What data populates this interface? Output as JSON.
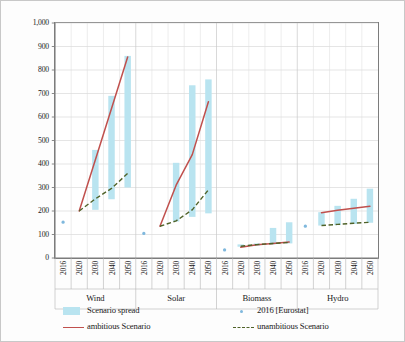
{
  "chart_data": {
    "type": "bar",
    "title": "",
    "xlabel": "",
    "ylabel": "Installed capacities [GW]",
    "ylim": [
      0,
      1000
    ],
    "ytick_labels": [
      "0",
      "100",
      "200",
      "300",
      "400",
      "500",
      "600",
      "700",
      "800",
      "900",
      "1,000"
    ],
    "ytick_values": [
      0,
      100,
      200,
      300,
      400,
      500,
      600,
      700,
      800,
      900,
      1000
    ],
    "grid": true,
    "legend_position": "bottom",
    "groups": [
      "Wind",
      "Solar",
      "Biomass",
      "Hydro"
    ],
    "years": [
      "2016",
      "2020",
      "2030",
      "2040",
      "2050"
    ],
    "legend": [
      {
        "key": "spread",
        "label": "Scenario spread",
        "marker": "band",
        "color": "#b9e4f0"
      },
      {
        "key": "eurostat",
        "label": "2016 [Eurostat]",
        "marker": "dot",
        "color": "#7fb8dd"
      },
      {
        "key": "ambitious",
        "label": "ambitious Scenario",
        "marker": "line",
        "color": "#c0504d"
      },
      {
        "key": "unambitious",
        "label": "unambitious Scenario",
        "marker": "dashed",
        "color": "#4f6228"
      }
    ],
    "series": [
      {
        "name": "Wind",
        "eurostat_2016": 153,
        "spread": [
          {
            "year": "2020",
            "min": null,
            "max": null
          },
          {
            "year": "2030",
            "min": 205,
            "max": 460
          },
          {
            "year": "2040",
            "min": 250,
            "max": 690
          },
          {
            "year": "2050",
            "min": 300,
            "max": 860
          }
        ],
        "ambitious": [
          {
            "year": "2020",
            "value": 200
          },
          {
            "year": "2030",
            "value": 418
          },
          {
            "year": "2040",
            "value": 636
          },
          {
            "year": "2050",
            "value": 855
          }
        ],
        "unambitious": [
          {
            "year": "2020",
            "value": 200
          },
          {
            "year": "2030",
            "value": 252
          },
          {
            "year": "2040",
            "value": 296
          },
          {
            "year": "2050",
            "value": 360
          }
        ]
      },
      {
        "name": "Solar",
        "eurostat_2016": 105,
        "spread": [
          {
            "year": "2020",
            "min": null,
            "max": null
          },
          {
            "year": "2030",
            "min": 155,
            "max": 405
          },
          {
            "year": "2040",
            "min": 175,
            "max": 735
          },
          {
            "year": "2050",
            "min": 190,
            "max": 760
          }
        ],
        "ambitious": [
          {
            "year": "2020",
            "value": 135
          },
          {
            "year": "2030",
            "value": 310
          },
          {
            "year": "2040",
            "value": 440
          },
          {
            "year": "2050",
            "value": 665
          }
        ],
        "unambitious": [
          {
            "year": "2020",
            "value": 135
          },
          {
            "year": "2030",
            "value": 158
          },
          {
            "year": "2040",
            "value": 205
          },
          {
            "year": "2050",
            "value": 290
          }
        ]
      },
      {
        "name": "Biomass",
        "eurostat_2016": 35,
        "spread": [
          {
            "year": "2020",
            "min": 48,
            "max": 58
          },
          {
            "year": "2030",
            "min": 52,
            "max": 62
          },
          {
            "year": "2040",
            "min": 58,
            "max": 128
          },
          {
            "year": "2050",
            "min": 62,
            "max": 152
          }
        ],
        "ambitious": [
          {
            "year": "2020",
            "value": 46
          },
          {
            "year": "2030",
            "value": 56
          },
          {
            "year": "2040",
            "value": 62
          },
          {
            "year": "2050",
            "value": 68
          }
        ],
        "unambitious": [
          {
            "year": "2020",
            "value": 50
          },
          {
            "year": "2030",
            "value": 57
          },
          {
            "year": "2040",
            "value": 62
          },
          {
            "year": "2050",
            "value": 66
          }
        ]
      },
      {
        "name": "Hydro",
        "eurostat_2016": 136,
        "spread": [
          {
            "year": "2020",
            "min": 138,
            "max": 195
          },
          {
            "year": "2030",
            "min": 140,
            "max": 222
          },
          {
            "year": "2040",
            "min": 145,
            "max": 252
          },
          {
            "year": "2050",
            "min": 150,
            "max": 295
          }
        ],
        "ambitious": [
          {
            "year": "2020",
            "value": 193
          },
          {
            "year": "2030",
            "value": 203
          },
          {
            "year": "2040",
            "value": 212
          },
          {
            "year": "2050",
            "value": 220
          }
        ],
        "unambitious": [
          {
            "year": "2020",
            "value": 138
          },
          {
            "year": "2030",
            "value": 143
          },
          {
            "year": "2040",
            "value": 148
          },
          {
            "year": "2050",
            "value": 152
          }
        ]
      }
    ]
  }
}
